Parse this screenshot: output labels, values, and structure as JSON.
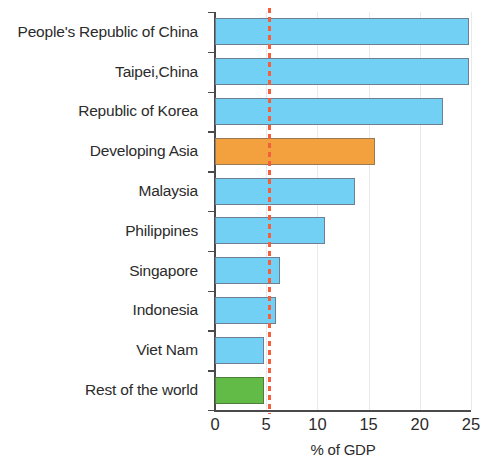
{
  "chart_data": {
    "type": "bar",
    "orientation": "horizontal",
    "title": "",
    "subtitle": "",
    "xlabel": "% of GDP",
    "ylabel": "",
    "xlim": [
      0,
      25
    ],
    "ylim": null,
    "grid": "vertical-light",
    "legend": null,
    "xticks": [
      "0",
      "5",
      "10",
      "15",
      "20",
      "25"
    ],
    "xtick_values": [
      0,
      5,
      10,
      15,
      20,
      25
    ],
    "categories": [
      "People's Republic of China",
      "Taipei,China",
      "Republic of Korea",
      "Developing Asia",
      "Malaysia",
      "Philippines",
      "Singapore",
      "Indonesia",
      "Viet Nam",
      "Rest of the world"
    ],
    "values": [
      24.8,
      24.8,
      22.3,
      15.6,
      13.7,
      10.7,
      6.3,
      6.0,
      4.8,
      4.8
    ],
    "bar_colors": [
      "#72d0f4",
      "#72d0f4",
      "#72d0f4",
      "#f2a13e",
      "#72d0f4",
      "#72d0f4",
      "#72d0f4",
      "#72d0f4",
      "#72d0f4",
      "#62bb46"
    ],
    "annotations": [
      {
        "kind": "reference-line",
        "orientation": "vertical",
        "value": 5.3,
        "style": "dashed",
        "color": "#f4603c",
        "label": ""
      }
    ],
    "colors": {
      "default_bar": "#72d0f4",
      "highlight_bar": "#f2a13e",
      "rest_of_world_bar": "#62bb46",
      "reference_line": "#f4603c",
      "axis": "#4a4a4a",
      "text": "#2b2b2b",
      "gridline": "#e9e9e9",
      "background": "#ffffff"
    }
  }
}
